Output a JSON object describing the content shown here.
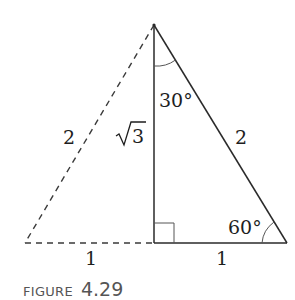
{
  "figure": {
    "caption_word": "FIGURE",
    "caption_number": "4.29",
    "colors": {
      "line": "#2a2a2a",
      "dashed": "#3a3a3a",
      "caption": "#555555"
    }
  },
  "labels": {
    "left_hypotenuse": "2",
    "right_hypotenuse": "2",
    "height": "√3",
    "height_radicand": "3",
    "top_angle": "30°",
    "bottom_right_angle": "60°",
    "left_base": "1",
    "right_base": "1"
  },
  "geometry": {
    "apex": [
      154,
      25
    ],
    "foot": [
      154,
      243
    ],
    "right_vertex": [
      287,
      243
    ],
    "left_vertex": [
      25,
      243
    ],
    "right_angle_marker_size": 20
  }
}
